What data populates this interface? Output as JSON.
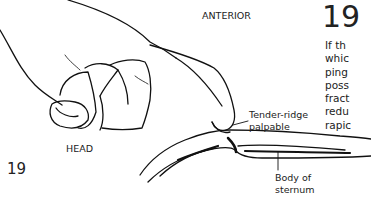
{
  "figure": {
    "number": "19",
    "labels": {
      "anterior": "ANTERIOR",
      "head": "HEAD",
      "tender_ridge": [
        "Tender-ridge",
        "palpable"
      ],
      "body_sternum": [
        "Body of",
        "sternum"
      ]
    },
    "illustration": "hand-palpating-sternum"
  },
  "text_column": {
    "section_number": "19",
    "lines": [
      "If th",
      "whic",
      "ping",
      "poss",
      "fract",
      "redu",
      "rapic"
    ]
  }
}
